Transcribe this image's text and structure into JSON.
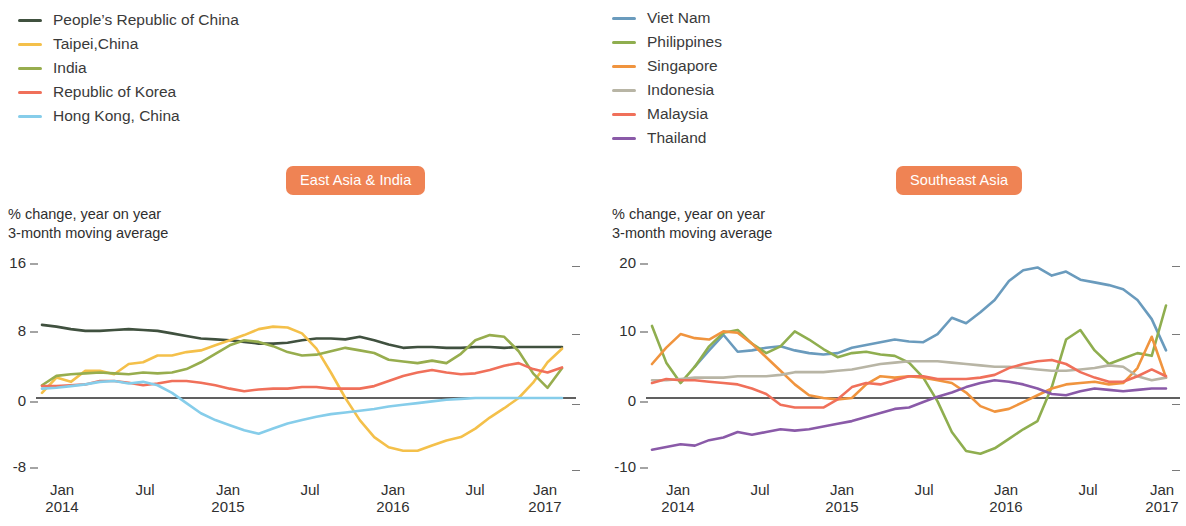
{
  "colors": {
    "badge_bg": "#ef8354",
    "zero_line": "#2b2b2b",
    "tick": "#4a4a4a",
    "prc": "#40513f",
    "taipei": "#f4c04a",
    "india": "#97ad4e",
    "korea": "#f0705a",
    "hongkong": "#86cdea",
    "vietnam": "#6a9bbd",
    "philippines": "#8fae4f",
    "singapore": "#f0943e",
    "indonesia": "#b8b5a5",
    "malaysia": "#f0705a",
    "thailand": "#8a5aa8"
  },
  "left": {
    "badge": "East Asia & India",
    "caption_line1": "% change, year on year",
    "caption_line2": "3-month moving average",
    "legend": [
      {
        "label": "People’s Republic of China",
        "color": "#40513f"
      },
      {
        "label": "Taipei,China",
        "color": "#f4c04a"
      },
      {
        "label": "India",
        "color": "#97ad4e"
      },
      {
        "label": "Republic of Korea",
        "color": "#f0705a"
      },
      {
        "label": "Hong Kong, China",
        "color": "#86cdea"
      }
    ],
    "yticks": [
      "16",
      "8",
      "0",
      "-8"
    ],
    "xticks": [
      {
        "month": "Jan",
        "year": "2014"
      },
      {
        "month": "Jul",
        "year": ""
      },
      {
        "month": "Jan",
        "year": "2015"
      },
      {
        "month": "Jul",
        "year": ""
      },
      {
        "month": "Jan",
        "year": "2016"
      },
      {
        "month": "Jul",
        "year": ""
      },
      {
        "month": "Jan",
        "year": "2017"
      }
    ]
  },
  "right": {
    "badge": "Southeast Asia",
    "caption_line1": "% change, year on year",
    "caption_line2": "3-month moving average",
    "legend": [
      {
        "label": "Viet Nam",
        "color": "#6a9bbd"
      },
      {
        "label": "Philippines",
        "color": "#8fae4f"
      },
      {
        "label": "Singapore",
        "color": "#f0943e"
      },
      {
        "label": "Indonesia",
        "color": "#b8b5a5"
      },
      {
        "label": "Malaysia",
        "color": "#f0705a"
      },
      {
        "label": "Thailand",
        "color": "#8a5aa8"
      }
    ],
    "yticks": [
      "20",
      "10",
      "0",
      "-10"
    ],
    "xticks": [
      {
        "month": "Jan",
        "year": "2014"
      },
      {
        "month": "Jul",
        "year": ""
      },
      {
        "month": "Jan",
        "year": "2015"
      },
      {
        "month": "Jul",
        "year": ""
      },
      {
        "month": "Jan",
        "year": "2016"
      },
      {
        "month": "Jul",
        "year": ""
      },
      {
        "month": "Jan",
        "year": "2017"
      }
    ]
  },
  "chart_data": [
    {
      "type": "line",
      "title": "East Asia & India",
      "subtitle": "% change, year on year / 3-month moving average",
      "xlabel": "",
      "ylabel": "% change, year on year",
      "ylim": [
        -8,
        16
      ],
      "yticks": [
        -8,
        0,
        8,
        16
      ],
      "grid": false,
      "legend_position": "top-left",
      "x": [
        "Jan 2014",
        "Feb 2014",
        "Mar 2014",
        "Apr 2014",
        "May 2014",
        "Jun 2014",
        "Jul 2014",
        "Aug 2014",
        "Sep 2014",
        "Oct 2014",
        "Nov 2014",
        "Dec 2014",
        "Jan 2015",
        "Feb 2015",
        "Mar 2015",
        "Apr 2015",
        "May 2015",
        "Jun 2015",
        "Jul 2015",
        "Aug 2015",
        "Sep 2015",
        "Oct 2015",
        "Nov 2015",
        "Dec 2015",
        "Jan 2016",
        "Feb 2016",
        "Mar 2016",
        "Apr 2016",
        "May 2016",
        "Jun 2016",
        "Jul 2016",
        "Aug 2016",
        "Sep 2016",
        "Oct 2016",
        "Nov 2016",
        "Dec 2016",
        "Jan 2017"
      ],
      "series": [
        {
          "name": "People’s Republic of China",
          "color": "#40513f",
          "values": [
            8.6,
            8.4,
            8.1,
            7.9,
            7.9,
            8.0,
            8.1,
            8.0,
            7.9,
            7.6,
            7.3,
            7.0,
            6.9,
            6.8,
            6.6,
            6.4,
            6.4,
            6.5,
            6.8,
            7.0,
            7.0,
            6.9,
            7.2,
            6.8,
            6.3,
            5.9,
            6.0,
            6.0,
            5.9,
            5.9,
            6.0,
            6.0,
            5.9,
            6.0,
            6.0,
            6.0,
            6.0
          ]
        },
        {
          "name": "Taipei,China",
          "color": "#f4c04a",
          "values": [
            0.6,
            2.4,
            1.9,
            3.2,
            3.2,
            2.8,
            4.0,
            4.2,
            5.0,
            5.0,
            5.4,
            5.6,
            6.2,
            6.8,
            7.4,
            8.1,
            8.4,
            8.3,
            7.6,
            5.8,
            3.0,
            0.0,
            -2.6,
            -4.6,
            -5.8,
            -6.2,
            -6.2,
            -5.6,
            -5.0,
            -4.6,
            -3.6,
            -2.3,
            -1.2,
            0.0,
            1.8,
            4.2,
            5.8
          ]
        },
        {
          "name": "India",
          "color": "#97ad4e",
          "values": [
            1.5,
            2.6,
            2.8,
            2.9,
            3.0,
            2.9,
            2.8,
            3.0,
            2.9,
            3.0,
            3.4,
            4.2,
            5.2,
            6.2,
            6.8,
            6.6,
            6.1,
            5.4,
            5.0,
            5.1,
            5.5,
            5.9,
            5.6,
            5.3,
            4.5,
            4.3,
            4.1,
            4.4,
            4.1,
            5.2,
            6.8,
            7.4,
            7.2,
            5.5,
            2.9,
            1.2,
            3.5
          ]
        },
        {
          "name": "Republic of Korea",
          "color": "#f0705a",
          "values": [
            1.4,
            1.4,
            1.5,
            1.6,
            2.0,
            2.0,
            1.8,
            1.5,
            1.7,
            2.0,
            2.0,
            1.8,
            1.5,
            1.1,
            0.8,
            1.0,
            1.1,
            1.1,
            1.3,
            1.3,
            1.1,
            1.1,
            1.1,
            1.4,
            2.0,
            2.6,
            3.0,
            3.3,
            3.0,
            2.8,
            2.9,
            3.3,
            3.8,
            4.1,
            3.4,
            3.0,
            3.6
          ]
        },
        {
          "name": "Hong Kong, China",
          "color": "#86cdea",
          "values": [
            1.1,
            1.2,
            1.4,
            1.6,
            1.9,
            2.0,
            1.7,
            1.9,
            1.5,
            0.6,
            -0.6,
            -1.8,
            -2.6,
            -3.2,
            -3.8,
            -4.2,
            -3.6,
            -3.0,
            -2.6,
            -2.2,
            -1.9,
            -1.7,
            -1.5,
            -1.3,
            -1.0,
            -0.8,
            -0.6,
            -0.4,
            -0.2,
            -0.1,
            0.0,
            0.0,
            0.0,
            0.0,
            0.0,
            0.0,
            0.0
          ]
        }
      ]
    },
    {
      "type": "line",
      "title": "Southeast Asia",
      "subtitle": "% change, year on year / 3-month moving average",
      "xlabel": "",
      "ylabel": "% change, year on year",
      "ylim": [
        -10,
        20
      ],
      "yticks": [
        -10,
        0,
        10,
        20
      ],
      "grid": false,
      "legend_position": "top-left",
      "x": [
        "Jan 2014",
        "Feb 2014",
        "Mar 2014",
        "Apr 2014",
        "May 2014",
        "Jun 2014",
        "Jul 2014",
        "Aug 2014",
        "Sep 2014",
        "Oct 2014",
        "Nov 2014",
        "Dec 2014",
        "Jan 2015",
        "Feb 2015",
        "Mar 2015",
        "Apr 2015",
        "May 2015",
        "Jun 2015",
        "Jul 2015",
        "Aug 2015",
        "Sep 2015",
        "Oct 2015",
        "Nov 2015",
        "Dec 2015",
        "Jan 2016",
        "Feb 2016",
        "Mar 2016",
        "Apr 2016",
        "May 2016",
        "Jun 2016",
        "Jul 2016",
        "Aug 2016",
        "Sep 2016",
        "Oct 2016",
        "Nov 2016",
        "Dec 2016",
        "Jan 2017"
      ],
      "series": [
        {
          "name": "Viet Nam",
          "color": "#6a9bbd",
          "values": [
            null,
            null,
            null,
            4.6,
            7.0,
            9.3,
            6.8,
            7.0,
            7.4,
            7.6,
            7.0,
            6.6,
            6.4,
            6.6,
            7.4,
            7.8,
            8.2,
            8.6,
            8.3,
            8.2,
            9.4,
            11.8,
            11.0,
            12.6,
            14.4,
            17.2,
            18.8,
            19.2,
            18.0,
            18.6,
            17.4,
            17.0,
            16.6,
            16.0,
            14.4,
            11.6,
            7.0
          ]
        },
        {
          "name": "Philippines",
          "color": "#8fae4f",
          "values": [
            10.6,
            5.2,
            2.2,
            4.6,
            7.6,
            9.6,
            10.0,
            8.0,
            6.6,
            7.6,
            9.8,
            8.6,
            7.2,
            6.0,
            6.6,
            6.8,
            6.4,
            6.2,
            5.2,
            3.0,
            -0.5,
            -5.0,
            -7.8,
            -8.2,
            -7.4,
            -6.0,
            -4.6,
            -3.4,
            1.6,
            8.6,
            10.0,
            7.0,
            5.0,
            5.8,
            6.6,
            6.2,
            13.6
          ]
        },
        {
          "name": "Singapore",
          "color": "#f0943e",
          "values": [
            5.0,
            7.4,
            9.4,
            8.8,
            8.6,
            9.8,
            9.6,
            8.0,
            6.0,
            4.0,
            2.0,
            0.4,
            0.0,
            -0.2,
            0.0,
            2.0,
            3.2,
            3.0,
            3.2,
            3.0,
            2.6,
            2.2,
            0.8,
            -1.2,
            -2.0,
            -1.6,
            -0.6,
            0.4,
            1.4,
            2.0,
            2.2,
            2.4,
            2.0,
            2.2,
            4.4,
            9.0,
            3.0
          ]
        },
        {
          "name": "Indonesia",
          "color": "#b8b5a5",
          "values": [
            2.6,
            2.6,
            2.8,
            3.0,
            3.0,
            3.0,
            3.2,
            3.2,
            3.2,
            3.4,
            3.8,
            3.8,
            3.8,
            4.0,
            4.2,
            4.6,
            5.0,
            5.2,
            5.4,
            5.4,
            5.4,
            5.2,
            5.0,
            4.8,
            4.6,
            4.6,
            4.4,
            4.2,
            4.0,
            4.0,
            4.2,
            4.4,
            4.8,
            4.6,
            3.2,
            2.6,
            3.0
          ]
        },
        {
          "name": "Malaysia",
          "color": "#f0705a",
          "values": [
            2.2,
            2.8,
            2.6,
            2.6,
            2.4,
            2.2,
            2.0,
            1.4,
            0.6,
            -1.0,
            -1.4,
            -1.4,
            -1.4,
            -0.2,
            1.6,
            2.2,
            2.0,
            2.6,
            3.2,
            3.2,
            2.8,
            2.8,
            2.8,
            3.0,
            3.4,
            4.4,
            5.0,
            5.4,
            5.6,
            5.0,
            3.8,
            3.0,
            2.4,
            2.4,
            3.2,
            4.2,
            3.2
          ]
        },
        {
          "name": "Thailand",
          "color": "#8a5aa8",
          "values": [
            -7.6,
            -7.2,
            -6.8,
            -7.0,
            -6.2,
            -5.8,
            -5.0,
            -5.4,
            -5.0,
            -4.6,
            -4.8,
            -4.6,
            -4.2,
            -3.8,
            -3.4,
            -2.8,
            -2.2,
            -1.6,
            -1.4,
            -0.6,
            0.2,
            0.8,
            1.6,
            2.2,
            2.6,
            2.4,
            2.0,
            1.4,
            0.6,
            0.4,
            1.0,
            1.4,
            1.2,
            1.0,
            1.2,
            1.4,
            1.4
          ]
        }
      ]
    }
  ]
}
